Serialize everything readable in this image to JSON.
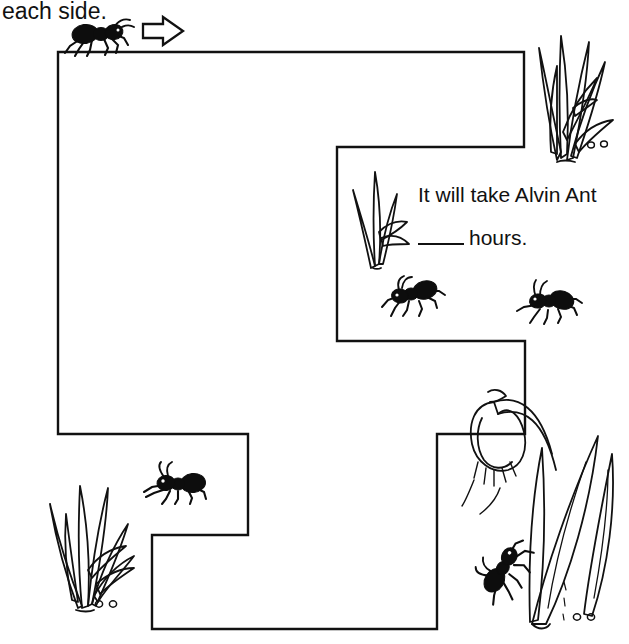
{
  "worksheet": {
    "instruction": "each side.",
    "question_line_1": "It will take Alvin Ant",
    "question_line_2_suffix": "hours.",
    "answer_blank": "",
    "ink_color": "#111111",
    "page_background": "#ffffff"
  },
  "maze": {
    "name": "ant-path-maze",
    "stroke_color": "#111111",
    "stroke_width": 2,
    "fill": "#ffffff",
    "outline_points": "58,52 524,52 524,147 337,147 337,341 525,341 525,434 437,434 437,629 152,629 152,535 248,535 248,434 58,434"
  },
  "start_marker": {
    "ant_label": "ant-start",
    "arrow_label": "direction-arrow-right"
  },
  "ants": [
    {
      "name": "ant-start",
      "x": 62,
      "y": 18,
      "width": 62,
      "height": 34,
      "facing": "right",
      "rotation": 0
    },
    {
      "name": "ant-mid-left",
      "x": 379,
      "y": 274,
      "width": 62,
      "height": 34,
      "facing": "left",
      "rotation": 8
    },
    {
      "name": "ant-mid-right",
      "x": 514,
      "y": 281,
      "width": 60,
      "height": 34,
      "facing": "left",
      "rotation": -20
    },
    {
      "name": "ant-lower-left",
      "x": 140,
      "y": 463,
      "width": 62,
      "height": 34,
      "facing": "right",
      "rotation": 0
    },
    {
      "name": "ant-flower-climb",
      "x": 486,
      "y": 546,
      "width": 58,
      "height": 34,
      "facing": "right",
      "rotation": -55
    }
  ],
  "plants": [
    {
      "name": "grass-tuft-top-right",
      "type": "tall-grass",
      "x": 527,
      "y": 12,
      "width": 96,
      "height": 150
    },
    {
      "name": "grass-sprig-middle",
      "type": "small-sprig",
      "x": 345,
      "y": 168,
      "width": 70,
      "height": 100
    },
    {
      "name": "grass-tuft-bottom-left",
      "type": "tall-grass",
      "x": 36,
      "y": 460,
      "width": 100,
      "height": 155
    },
    {
      "name": "flower-bottom-right",
      "type": "bell-flower",
      "x": 470,
      "y": 360,
      "width": 150,
      "height": 270
    }
  ],
  "pebbles": [
    {
      "name": "pebble-pair-top-right",
      "x": 592,
      "y": 140
    },
    {
      "name": "pebble-pair-bottom-left",
      "x": 97,
      "y": 600
    },
    {
      "name": "pebble-pair-bottom-right",
      "x": 575,
      "y": 613
    }
  ]
}
